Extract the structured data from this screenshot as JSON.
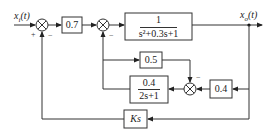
{
  "diagram": {
    "type": "control-block-diagram",
    "input": {
      "label": "x",
      "subscript": "i",
      "arg": "(t)"
    },
    "output": {
      "label": "x",
      "subscript": "o",
      "arg": "(t)"
    },
    "summing_junctions": [
      {
        "id": "sum1",
        "signs": {
          "input": "+",
          "feedback": "−"
        }
      },
      {
        "id": "sum2",
        "signs": {
          "feedback": "−"
        }
      },
      {
        "id": "sum3",
        "signs": {
          "top": "−"
        }
      }
    ],
    "blocks": {
      "gain_07": "0.7",
      "plant": {
        "numerator": "1",
        "denominator": "s²+0.3s+1"
      },
      "gain_05": "0.5",
      "gain_04": "0.4",
      "filter": {
        "numerator": "0.4",
        "denominator": "2s+1"
      },
      "derivative": "Ks"
    }
  }
}
